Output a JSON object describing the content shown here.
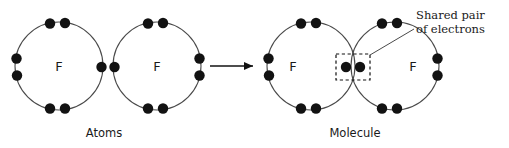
{
  "diagram": {
    "background_color": "#ffffff",
    "stroke_color": "#4a4a4a",
    "electron_color": "#121212",
    "text_color": "#1a1a1a"
  },
  "left_panel": {
    "caption": "Atoms",
    "caption_x": 104,
    "caption_y": 137,
    "atoms": [
      {
        "symbol": "F",
        "cx": 59,
        "cy": 66,
        "r": 44,
        "symbol_dx": 0,
        "symbol_dy": 0,
        "electrons": [
          {
            "name": "top-left",
            "x": 50,
            "y": 23.5
          },
          {
            "name": "top-right",
            "x": 65,
            "y": 23.0
          },
          {
            "name": "left-upper",
            "x": 16.5,
            "y": 58.5
          },
          {
            "name": "left-lower",
            "x": 17.0,
            "y": 75.5
          },
          {
            "name": "bottom-left",
            "x": 50,
            "y": 108.5
          },
          {
            "name": "bottom-right",
            "x": 65,
            "y": 108.5
          },
          {
            "name": "right-single",
            "x": 101.5,
            "y": 67.0
          }
        ]
      },
      {
        "symbol": "F",
        "cx": 157,
        "cy": 66,
        "r": 44,
        "symbol_dx": 0,
        "symbol_dy": 0,
        "electrons": [
          {
            "name": "left-single",
            "x": 114.5,
            "y": 67.0
          },
          {
            "name": "top-left",
            "x": 148,
            "y": 23.5
          },
          {
            "name": "top-right",
            "x": 163,
            "y": 23.0
          },
          {
            "name": "right-upper",
            "x": 199.5,
            "y": 58.5
          },
          {
            "name": "right-lower",
            "x": 199.5,
            "y": 75.5
          },
          {
            "name": "bottom-left",
            "x": 148,
            "y": 108.5
          },
          {
            "name": "bottom-right",
            "x": 163,
            "y": 108.5
          }
        ]
      }
    ]
  },
  "arrow": {
    "name": "reaction-arrow",
    "x1": 210,
    "y1": 66,
    "x2": 253,
    "y2": 66,
    "head_points": "253,66 244,62 244,70"
  },
  "right_panel": {
    "caption": "Molecule",
    "caption_x": 355,
    "caption_y": 137,
    "atoms": [
      {
        "symbol": "F",
        "cx": 311,
        "cy": 66,
        "r": 44,
        "symbol_dx": -18,
        "symbol_dy": 0,
        "electrons": [
          {
            "name": "top-left",
            "x": 301,
            "y": 23.5
          },
          {
            "name": "top-right",
            "x": 316,
            "y": 23.0
          },
          {
            "name": "left-upper",
            "x": 268.5,
            "y": 58.5
          },
          {
            "name": "left-lower",
            "x": 269,
            "y": 75.5
          },
          {
            "name": "bottom-left",
            "x": 301,
            "y": 108.5
          },
          {
            "name": "bottom-right",
            "x": 316,
            "y": 108.5
          }
        ]
      },
      {
        "symbol": "F",
        "cx": 395,
        "cy": 66,
        "r": 44,
        "symbol_dx": 18,
        "symbol_dy": 0,
        "electrons": [
          {
            "name": "top-left",
            "x": 382,
            "y": 23.5
          },
          {
            "name": "top-right",
            "x": 397,
            "y": 23.0
          },
          {
            "name": "right-upper",
            "x": 437.5,
            "y": 58.5
          },
          {
            "name": "right-lower",
            "x": 437.5,
            "y": 75.5
          },
          {
            "name": "bottom-left",
            "x": 382,
            "y": 108.5
          },
          {
            "name": "bottom-right",
            "x": 397,
            "y": 108.5
          }
        ]
      }
    ],
    "shared_pair": {
      "name": "shared-electron-pair",
      "electrons": [
        {
          "name": "shared-left",
          "x": 346,
          "y": 67
        },
        {
          "name": "shared-right",
          "x": 360,
          "y": 67
        }
      ],
      "box": {
        "x": 336,
        "y": 54,
        "width": 34,
        "height": 26
      }
    }
  },
  "annotation": {
    "name": "shared-pair-annotation",
    "line1": "Shared pair",
    "line2": "of electrons",
    "text_x": 416,
    "text_y1": 19,
    "text_y2": 33,
    "leader": {
      "x1": 370,
      "y1": 55,
      "x2": 414,
      "y2": 29
    }
  },
  "electron_radius": 5.2
}
